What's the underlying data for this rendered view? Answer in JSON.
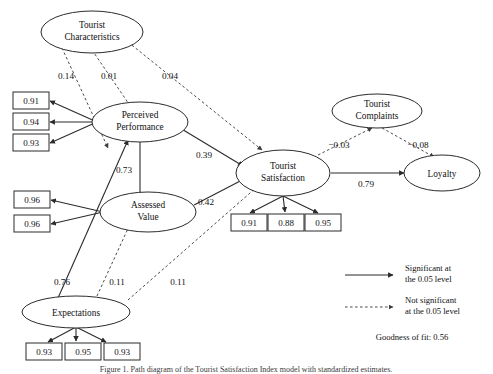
{
  "figure": {
    "caption": "Figure 1. Path diagram of the Tourist Satisfaction Index model with standardized estimates.",
    "goodness_of_fit": "Goodness of fit: 0.56"
  },
  "legend": {
    "significant": {
      "line1": "Significant at",
      "line2": "the 0.05 level"
    },
    "not_significant": {
      "line1": "Not significant",
      "line2": "at the 0.05 level"
    }
  },
  "latent_nodes": {
    "tourist_characteristics": {
      "line1": "Tourist",
      "line2": "Characteristics"
    },
    "perceived_performance": {
      "line1": "Perceived",
      "line2": "Performance"
    },
    "assessed_value": {
      "line1": "Assessed",
      "line2": "Value"
    },
    "expectations": {
      "line1": "Expectations"
    },
    "tourist_satisfaction": {
      "line1": "Tourist",
      "line2": "Satisfaction"
    },
    "tourist_complaints": {
      "line1": "Tourist",
      "line2": "Complaints"
    },
    "loyalty": {
      "line1": "Loyalty"
    }
  },
  "indicators": {
    "perceived_performance": [
      "0.91",
      "0.94",
      "0.93"
    ],
    "assessed_value": [
      "0.96",
      "0.96"
    ],
    "expectations": [
      "0.93",
      "0.95",
      "0.93"
    ],
    "tourist_satisfaction": [
      "0.91",
      "0.88",
      "0.95"
    ]
  },
  "coefficients": {
    "tc_to_pp_left": "0.14",
    "tc_to_pp_mid": "0.01",
    "tc_to_ts": "0.04",
    "pp_to_av": "0.73",
    "pp_to_ts": "0.39",
    "av_to_ts": "0.42",
    "exp_to_pp": "0.76",
    "exp_to_av": "0.11",
    "exp_to_ts": "0.11",
    "ts_to_tcomp": "−0.03",
    "tcomp_to_loy": "−0.08",
    "ts_to_loy": "0.79"
  },
  "colors": {
    "stroke": "#2b2b2b",
    "dashed_stroke": "#4a4a4a",
    "background": "#ffffff"
  }
}
